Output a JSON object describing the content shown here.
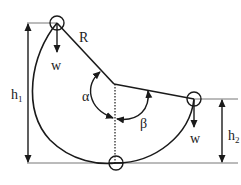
{
  "diagram": {
    "type": "physics-pendulum-swing",
    "labels": {
      "radius": "R",
      "weight_top": "w",
      "weight_right": "w",
      "height1_main": "h",
      "height1_sub": "1",
      "height2_main": "h",
      "height2_sub": "2",
      "angle_alpha": "α",
      "angle_beta": "β"
    },
    "colors": {
      "stroke": "#1a1a1a",
      "ground_line": "#777777"
    }
  }
}
